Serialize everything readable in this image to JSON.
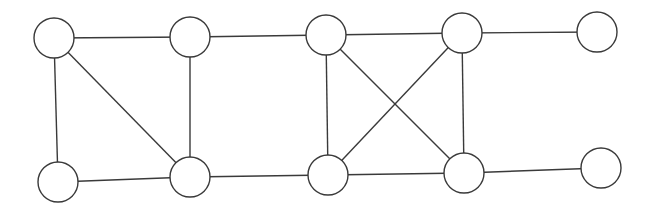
{
  "diagram": {
    "type": "undirected-graph",
    "width": 653,
    "height": 212,
    "stroke_color": "#3a3a3a",
    "fill_color": "#ffffff",
    "node_radius": 20,
    "nodes": [
      {
        "id": "n1",
        "x": 54,
        "y": 38,
        "label": ""
      },
      {
        "id": "n2",
        "x": 190,
        "y": 37,
        "label": ""
      },
      {
        "id": "n3",
        "x": 326,
        "y": 35,
        "label": ""
      },
      {
        "id": "n4",
        "x": 462,
        "y": 33,
        "label": ""
      },
      {
        "id": "n5",
        "x": 597,
        "y": 32,
        "label": ""
      },
      {
        "id": "n6",
        "x": 58,
        "y": 182,
        "label": ""
      },
      {
        "id": "n7",
        "x": 190,
        "y": 177,
        "label": ""
      },
      {
        "id": "n8",
        "x": 328,
        "y": 175,
        "label": ""
      },
      {
        "id": "n9",
        "x": 464,
        "y": 173,
        "label": ""
      },
      {
        "id": "n10",
        "x": 601,
        "y": 168,
        "label": ""
      }
    ],
    "edges": [
      {
        "from": "n1",
        "to": "n2"
      },
      {
        "from": "n1",
        "to": "n6"
      },
      {
        "from": "n1",
        "to": "n7"
      },
      {
        "from": "n2",
        "to": "n3"
      },
      {
        "from": "n2",
        "to": "n7"
      },
      {
        "from": "n6",
        "to": "n7"
      },
      {
        "from": "n7",
        "to": "n8"
      },
      {
        "from": "n3",
        "to": "n4"
      },
      {
        "from": "n3",
        "to": "n8"
      },
      {
        "from": "n3",
        "to": "n9"
      },
      {
        "from": "n4",
        "to": "n8"
      },
      {
        "from": "n4",
        "to": "n9"
      },
      {
        "from": "n8",
        "to": "n9"
      },
      {
        "from": "n4",
        "to": "n5"
      },
      {
        "from": "n9",
        "to": "n10"
      }
    ]
  }
}
